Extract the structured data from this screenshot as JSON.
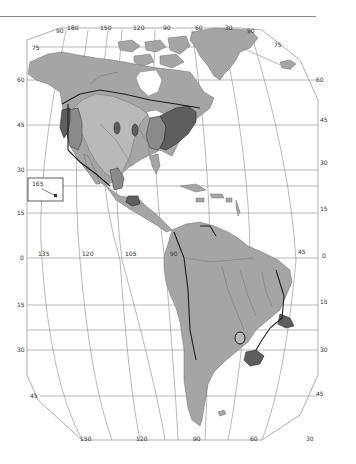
{
  "map": {
    "title": "",
    "region": "Americas",
    "colors": {
      "background": "#ffffff",
      "land": "#a5a5a5",
      "light_zone": "#b9b9b9",
      "mid_zone": "#8a8a8a",
      "dark_zone": "#5e5e5e",
      "grid": "#8c8c8c",
      "border": "#1e1e1e"
    },
    "top_longitude_labels": [
      "90",
      "180",
      "150",
      "120",
      "90",
      "60",
      "30",
      "90"
    ],
    "top_latitude_labels": {
      "left_75": "75",
      "right_75": "75"
    },
    "left_latitude_labels": [
      "60",
      "45",
      "30",
      "15",
      "0",
      "15",
      "30",
      "45"
    ],
    "right_latitude_labels": [
      "60",
      "45",
      "30",
      "15",
      "0",
      "15",
      "30",
      "45"
    ],
    "equator_longitude_labels": [
      "135",
      "120",
      "105",
      "90",
      "45"
    ],
    "bottom_longitude_labels": [
      "150",
      "120",
      "90",
      "60",
      "30"
    ],
    "inset": {
      "label": "165",
      "name": "Hawaii inset"
    }
  }
}
